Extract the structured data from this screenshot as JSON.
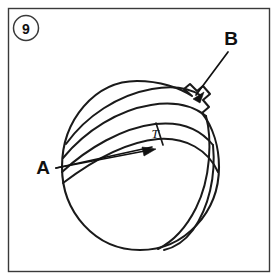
{
  "figure": {
    "callout_number": "9",
    "caption_labels": {
      "label_a": "A",
      "label_b": "B",
      "dimension_t": "T"
    },
    "colors": {
      "ink": "#1a1a1a",
      "frame": "#3a3a3a",
      "background": "#ffffff"
    },
    "icons": {
      "callout_marker": "circled-number-icon",
      "leader_a": "arrow-icon",
      "leader_b": "arrow-icon"
    }
  }
}
